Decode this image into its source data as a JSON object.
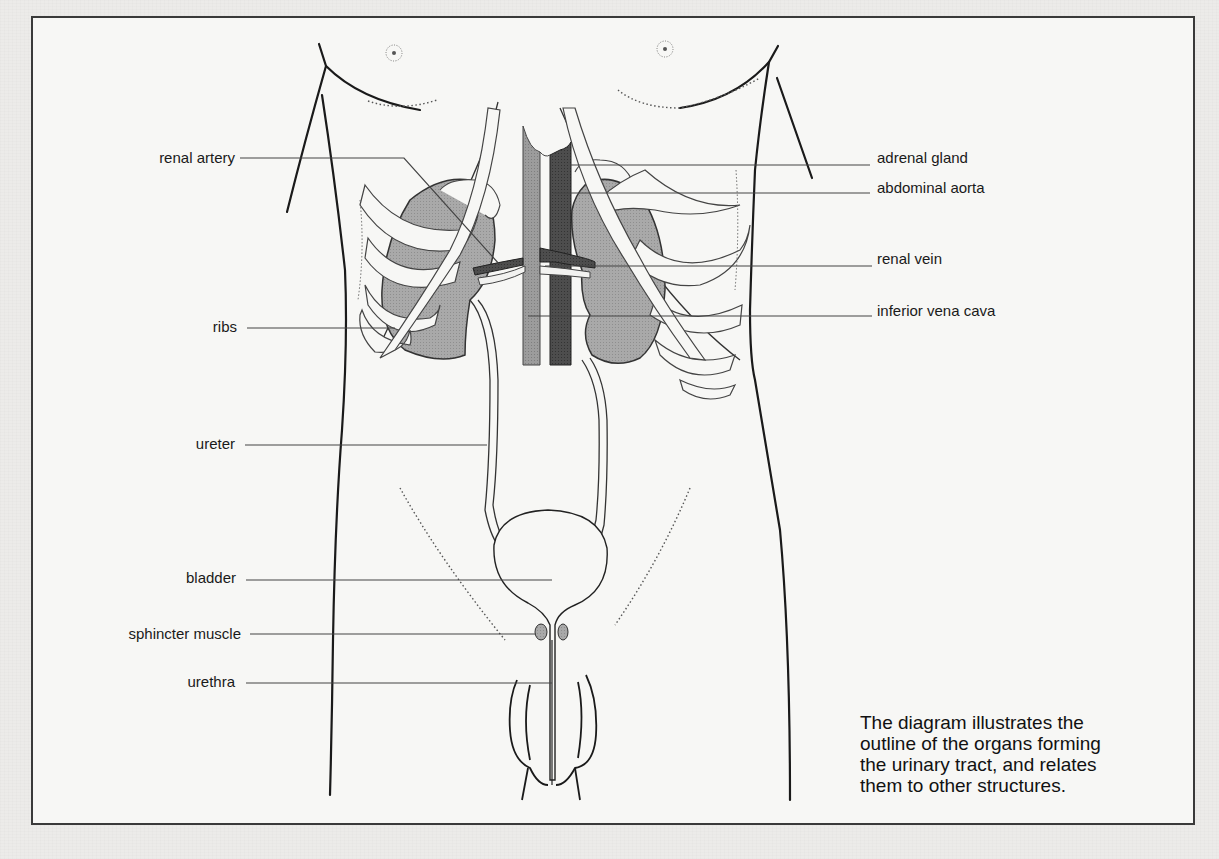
{
  "diagram": {
    "title": "Urinary tract",
    "colors": {
      "frame": "#3a3a3a",
      "outline": "#1a1a1a",
      "kidney_fill": "#a8a8a8",
      "aorta_fill": "#4a4a4a",
      "vena_cava_fill": "#9a9a9a",
      "leader_line": "#444444",
      "background": "#f7f7f5"
    },
    "labels_left": [
      {
        "id": "renal-artery",
        "text": "renal artery"
      },
      {
        "id": "ribs",
        "text": "ribs"
      },
      {
        "id": "ureter",
        "text": "ureter"
      },
      {
        "id": "bladder",
        "text": "bladder"
      },
      {
        "id": "sphincter-muscle",
        "text": "sphincter muscle"
      },
      {
        "id": "urethra",
        "text": "urethra"
      }
    ],
    "labels_right": [
      {
        "id": "adrenal-gland",
        "text": "adrenal gland"
      },
      {
        "id": "abdominal-aorta",
        "text": "abdominal aorta"
      },
      {
        "id": "renal-vein",
        "text": "renal vein"
      },
      {
        "id": "inferior-vena-cava",
        "text": "inferior vena cava"
      }
    ],
    "caption": {
      "lines": [
        "The diagram illustrates the",
        "outline of the organs forming",
        "the urinary tract, and relates",
        "them to other structures."
      ]
    }
  }
}
